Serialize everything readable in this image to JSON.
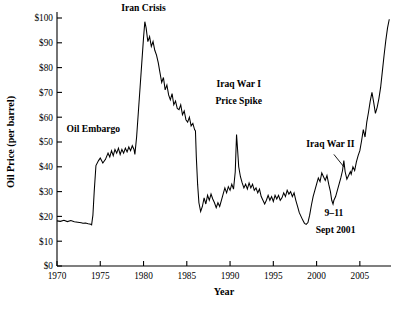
{
  "chart_data": {
    "type": "line",
    "title": "",
    "xlabel": "Year",
    "ylabel": "Oil Price (per barrel)",
    "xlim": [
      1970,
      2008.6
    ],
    "ylim": [
      0,
      105
    ],
    "grid": false,
    "legend": null,
    "xticks": [
      1970,
      1975,
      1980,
      1985,
      1990,
      1995,
      2000,
      2005
    ],
    "xticklabels": [
      "1970",
      "1975",
      "1980",
      "1985",
      "1990",
      "1995",
      "2000",
      "2005"
    ],
    "yticks": [
      0,
      10,
      20,
      30,
      40,
      50,
      60,
      70,
      80,
      90,
      100
    ],
    "yticklabels": [
      "$0",
      "$10",
      "$20",
      "$30",
      "$40",
      "$50",
      "$60",
      "$70",
      "$80",
      "$90",
      "$100"
    ],
    "series": [
      {
        "name": "Oil Price (inflation adjusted, per barrel)",
        "color": "#000000",
        "x": [
          1970.0,
          1970.4,
          1970.8,
          1971.2,
          1971.6,
          1972.0,
          1972.4,
          1972.8,
          1973.0,
          1973.3,
          1973.6,
          1973.9,
          1974.0,
          1974.15,
          1974.3,
          1974.5,
          1974.8,
          1975.0,
          1975.3,
          1975.6,
          1975.9,
          1976.1,
          1976.3,
          1976.5,
          1976.7,
          1976.9,
          1977.1,
          1977.3,
          1977.5,
          1977.7,
          1977.9,
          1978.1,
          1978.3,
          1978.5,
          1978.7,
          1978.9,
          1979.0,
          1979.2,
          1979.4,
          1979.6,
          1979.8,
          1980.0,
          1980.15,
          1980.3,
          1980.5,
          1980.7,
          1980.9,
          1981.1,
          1981.3,
          1981.5,
          1981.7,
          1981.9,
          1982.1,
          1982.3,
          1982.5,
          1982.7,
          1982.9,
          1983.1,
          1983.3,
          1983.5,
          1983.7,
          1983.9,
          1984.1,
          1984.3,
          1984.5,
          1984.7,
          1984.9,
          1985.1,
          1985.3,
          1985.5,
          1985.7,
          1985.9,
          1986.0,
          1986.1,
          1986.25,
          1986.4,
          1986.6,
          1986.8,
          1987.0,
          1987.2,
          1987.4,
          1987.6,
          1987.8,
          1988.0,
          1988.2,
          1988.4,
          1988.6,
          1988.8,
          1989.0,
          1989.2,
          1989.4,
          1989.6,
          1989.8,
          1990.0,
          1990.2,
          1990.4,
          1990.6,
          1990.75,
          1990.85,
          1991.0,
          1991.2,
          1991.4,
          1991.6,
          1991.8,
          1992.0,
          1992.2,
          1992.4,
          1992.6,
          1992.8,
          1993.0,
          1993.2,
          1993.4,
          1993.6,
          1993.8,
          1994.0,
          1994.2,
          1994.4,
          1994.6,
          1994.8,
          1995.0,
          1995.2,
          1995.4,
          1995.6,
          1995.8,
          1996.0,
          1996.2,
          1996.4,
          1996.6,
          1996.8,
          1997.0,
          1997.2,
          1997.4,
          1997.6,
          1997.8,
          1998.0,
          1998.2,
          1998.4,
          1998.6,
          1998.8,
          1999.0,
          1999.2,
          1999.4,
          1999.6,
          1999.8,
          2000.0,
          2000.2,
          2000.4,
          2000.6,
          2000.8,
          2001.0,
          2001.2,
          2001.4,
          2001.6,
          2001.75,
          2001.9,
          2002.0,
          2002.2,
          2002.4,
          2002.6,
          2002.8,
          2003.0,
          2003.15,
          2003.3,
          2003.5,
          2003.7,
          2003.9,
          2004.0,
          2004.2,
          2004.4,
          2004.6,
          2004.8,
          2005.0,
          2005.2,
          2005.4,
          2005.6,
          2005.8,
          2006.0,
          2006.2,
          2006.4,
          2006.6,
          2006.8,
          2007.0,
          2007.2,
          2007.4,
          2007.6,
          2007.8,
          2008.0,
          2008.2,
          2008.4
        ],
        "y": [
          18.2,
          18.0,
          18.4,
          17.9,
          18.3,
          17.8,
          17.6,
          17.4,
          17.2,
          17.3,
          17.0,
          16.8,
          16.6,
          20.5,
          30.0,
          40.5,
          42.5,
          43.5,
          41.5,
          43.0,
          45.5,
          44.0,
          46.5,
          44.5,
          47.0,
          45.5,
          47.5,
          45.0,
          47.0,
          45.5,
          47.5,
          46.0,
          48.0,
          46.5,
          48.5,
          47.0,
          45.0,
          52.0,
          62.0,
          72.0,
          82.0,
          92.0,
          98.5,
          96.0,
          90.5,
          92.5,
          88.5,
          90.5,
          87.0,
          85.0,
          82.0,
          78.0,
          74.0,
          76.0,
          71.0,
          73.0,
          69.0,
          67.0,
          69.5,
          65.0,
          66.5,
          63.5,
          63.0,
          65.0,
          61.0,
          62.5,
          59.0,
          58.0,
          60.0,
          56.5,
          57.5,
          55.0,
          54.5,
          44.0,
          33.0,
          25.5,
          22.0,
          24.0,
          27.5,
          25.0,
          28.5,
          26.5,
          29.0,
          27.0,
          25.5,
          23.5,
          25.5,
          24.0,
          26.5,
          29.0,
          31.5,
          29.5,
          32.0,
          30.5,
          33.0,
          31.0,
          38.0,
          53.0,
          48.0,
          40.0,
          36.0,
          33.5,
          31.5,
          33.0,
          31.0,
          33.5,
          31.5,
          33.0,
          30.5,
          31.5,
          29.5,
          31.0,
          28.0,
          26.5,
          25.0,
          26.5,
          28.5,
          26.5,
          28.0,
          26.0,
          28.5,
          27.0,
          28.5,
          26.5,
          27.5,
          29.5,
          28.0,
          30.5,
          29.0,
          30.0,
          28.0,
          29.5,
          26.5,
          24.0,
          21.5,
          20.0,
          18.5,
          17.2,
          16.8,
          17.5,
          20.5,
          24.5,
          28.0,
          30.5,
          33.0,
          35.5,
          34.0,
          37.5,
          36.0,
          34.5,
          36.5,
          33.0,
          30.0,
          26.5,
          25.0,
          26.5,
          28.0,
          30.5,
          33.0,
          35.5,
          38.5,
          42.5,
          38.0,
          35.0,
          36.5,
          38.0,
          37.0,
          40.0,
          38.5,
          42.0,
          44.5,
          46.5,
          50.5,
          55.0,
          52.0,
          58.0,
          62.0,
          66.5,
          70.0,
          66.0,
          61.5,
          64.0,
          67.5,
          72.0,
          78.5,
          85.0,
          91.0,
          96.0,
          99.5
        ]
      }
    ],
    "annotations": [
      {
        "text": "Iran Crisis",
        "x": 1980.0,
        "y": 103.0,
        "name": "iran-crisis"
      },
      {
        "text": "Oil Embargo",
        "x": 1974.2,
        "y": 54.0,
        "name": "oil-embargo"
      },
      {
        "text": "Iraq War I",
        "x": 1991.0,
        "y": 72.0,
        "name": "iraq-war-1-line1"
      },
      {
        "text": "Price Spike",
        "x": 1991.0,
        "y": 65.5,
        "name": "iraq-war-1-line2"
      },
      {
        "text": "Iraq War II",
        "x": 2001.6,
        "y": 48.0,
        "name": "iraq-war-2"
      },
      {
        "text": "9–11",
        "x": 2002.0,
        "y": 20.0,
        "name": "nine-eleven-line1"
      },
      {
        "text": "Sept 2001",
        "x": 2002.2,
        "y": 13.5,
        "name": "nine-eleven-line2"
      }
    ]
  }
}
